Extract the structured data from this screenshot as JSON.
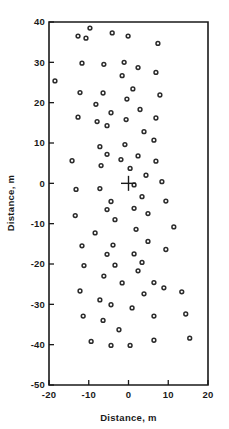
{
  "chart_data": {
    "type": "scatter",
    "title": "",
    "xlabel": "Distance, m",
    "ylabel": "Distance, m",
    "xlim": [
      -20,
      20
    ],
    "ylim": [
      -50,
      40
    ],
    "xticks": [
      -20,
      -10,
      0,
      10,
      20
    ],
    "xtick_labels": [
      "-20",
      "-10",
      "0",
      "10",
      "20"
    ],
    "yticks": [
      -50,
      -40,
      -30,
      -20,
      -10,
      0,
      10,
      20,
      30,
      40
    ],
    "ytick_labels": [
      "-50",
      "-40",
      "-30",
      "-20",
      "-10",
      "0",
      "10",
      "20",
      "30",
      "40"
    ],
    "grid": false,
    "legend": null,
    "marker": "open-circle",
    "marker_color": "#2b2b2b",
    "annotations": [
      {
        "name": "origin-cross",
        "symbol": "plus",
        "x": 0,
        "y": 0
      }
    ],
    "points": [
      {
        "x": -9.7,
        "y": 38.5
      },
      {
        "x": -12.7,
        "y": 36.5
      },
      {
        "x": -10.7,
        "y": 36.0
      },
      {
        "x": -4.1,
        "y": 37.3
      },
      {
        "x": -0.1,
        "y": 36.5
      },
      {
        "x": 7.4,
        "y": 34.7
      },
      {
        "x": -18.5,
        "y": 25.4
      },
      {
        "x": -11.7,
        "y": 29.8
      },
      {
        "x": -6.2,
        "y": 29.5
      },
      {
        "x": -1.1,
        "y": 30.0
      },
      {
        "x": 2.4,
        "y": 28.7
      },
      {
        "x": 6.9,
        "y": 27.5
      },
      {
        "x": -1.6,
        "y": 26.7
      },
      {
        "x": -12.2,
        "y": 22.5
      },
      {
        "x": -6.4,
        "y": 22.4
      },
      {
        "x": 1.1,
        "y": 23.4
      },
      {
        "x": -0.4,
        "y": 20.9
      },
      {
        "x": 7.9,
        "y": 21.9
      },
      {
        "x": -8.2,
        "y": 19.6
      },
      {
        "x": -4.4,
        "y": 17.5
      },
      {
        "x": 2.9,
        "y": 18.3
      },
      {
        "x": -12.7,
        "y": 16.4
      },
      {
        "x": -7.9,
        "y": 15.3
      },
      {
        "x": -5.4,
        "y": 14.3
      },
      {
        "x": -0.6,
        "y": 15.8
      },
      {
        "x": 6.9,
        "y": 16.2
      },
      {
        "x": 3.9,
        "y": 12.8
      },
      {
        "x": -7.2,
        "y": 9.1
      },
      {
        "x": -0.9,
        "y": 9.6
      },
      {
        "x": 6.4,
        "y": 10.7
      },
      {
        "x": -5.4,
        "y": 7.2
      },
      {
        "x": -6.9,
        "y": 4.4
      },
      {
        "x": -14.2,
        "y": 5.6
      },
      {
        "x": -1.9,
        "y": 5.9
      },
      {
        "x": 2.4,
        "y": 6.8
      },
      {
        "x": 6.9,
        "y": 5.5
      },
      {
        "x": 0.4,
        "y": 3.7
      },
      {
        "x": 4.4,
        "y": 2.0
      },
      {
        "x": 1.4,
        "y": -0.4
      },
      {
        "x": 8.4,
        "y": 0.4
      },
      {
        "x": -13.2,
        "y": -1.5
      },
      {
        "x": -7.2,
        "y": -1.3
      },
      {
        "x": -4.4,
        "y": -4.5
      },
      {
        "x": 3.4,
        "y": -3.3
      },
      {
        "x": 9.4,
        "y": -4.4
      },
      {
        "x": -13.4,
        "y": -8.0
      },
      {
        "x": -5.4,
        "y": -6.5
      },
      {
        "x": -3.4,
        "y": -9.0
      },
      {
        "x": 1.4,
        "y": -6.2
      },
      {
        "x": 4.9,
        "y": -7.5
      },
      {
        "x": 1.9,
        "y": -11.4
      },
      {
        "x": -8.4,
        "y": -12.3
      },
      {
        "x": -11.7,
        "y": -15.5
      },
      {
        "x": -3.9,
        "y": -15.3
      },
      {
        "x": 4.9,
        "y": -14.4
      },
      {
        "x": 11.4,
        "y": -10.8
      },
      {
        "x": -5.4,
        "y": -17.6
      },
      {
        "x": 1.4,
        "y": -17.5
      },
      {
        "x": -11.2,
        "y": -20.4
      },
      {
        "x": -3.4,
        "y": -20.3
      },
      {
        "x": 3.4,
        "y": -19.6
      },
      {
        "x": 9.4,
        "y": -16.4
      },
      {
        "x": -6.2,
        "y": -23.0
      },
      {
        "x": 2.4,
        "y": -21.7
      },
      {
        "x": -1.6,
        "y": -24.7
      },
      {
        "x": 6.4,
        "y": -24.6
      },
      {
        "x": -12.2,
        "y": -26.7
      },
      {
        "x": -7.2,
        "y": -28.9
      },
      {
        "x": 3.9,
        "y": -27.4
      },
      {
        "x": 8.9,
        "y": -25.9
      },
      {
        "x": 13.4,
        "y": -26.9
      },
      {
        "x": -4.4,
        "y": -30.1
      },
      {
        "x": 0.9,
        "y": -30.9
      },
      {
        "x": -11.4,
        "y": -32.9
      },
      {
        "x": -6.4,
        "y": -34.0
      },
      {
        "x": 6.4,
        "y": -32.9
      },
      {
        "x": 14.4,
        "y": -32.4
      },
      {
        "x": -2.4,
        "y": -36.3
      },
      {
        "x": -9.4,
        "y": -39.2
      },
      {
        "x": -4.4,
        "y": -40.2
      },
      {
        "x": 0.4,
        "y": -40.2
      },
      {
        "x": 6.4,
        "y": -38.9
      },
      {
        "x": 15.4,
        "y": -38.4
      }
    ]
  },
  "axes": {
    "x_title": "Distance, m",
    "y_title": "Distance, m"
  }
}
